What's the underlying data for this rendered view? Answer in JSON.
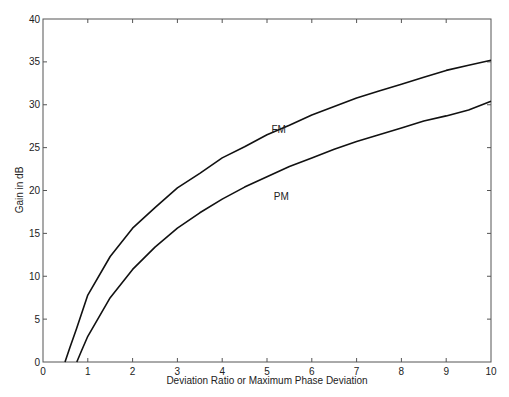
{
  "chart_data": {
    "type": "line",
    "title": "",
    "xlabel": "Deviation Ratio or Maximum Phase Deviation",
    "ylabel": "Gain in dB",
    "xlim": [
      0,
      10
    ],
    "ylim": [
      0,
      40
    ],
    "xticks": [
      0,
      1,
      2,
      3,
      4,
      5,
      6,
      7,
      8,
      9,
      10
    ],
    "yticks": [
      0,
      5,
      10,
      15,
      20,
      25,
      30,
      35,
      40
    ],
    "grid": false,
    "legend": "none (inline labels)",
    "annotations": [
      {
        "text": "FM",
        "x": 5.1,
        "y": 27.2
      },
      {
        "text": "PM",
        "x": 5.15,
        "y": 19.4
      }
    ],
    "series": [
      {
        "name": "FM",
        "color": "#111111",
        "x": [
          0.49,
          0.6,
          0.75,
          1,
          1.5,
          2,
          2.5,
          3,
          3.5,
          4,
          4.5,
          5,
          5.5,
          6,
          6.5,
          7,
          7.5,
          8,
          8.5,
          9,
          9.5,
          10
        ],
        "y": [
          0.0,
          1.7,
          3.9,
          7.8,
          12.3,
          15.6,
          18.0,
          20.3,
          22.0,
          23.8,
          25.1,
          26.5,
          27.6,
          28.8,
          29.8,
          30.8,
          31.6,
          32.4,
          33.2,
          34.0,
          34.6,
          35.2
        ]
      },
      {
        "name": "PM",
        "color": "#111111",
        "x": [
          0.755,
          0.85,
          1,
          1.5,
          2,
          2.5,
          3,
          3.5,
          4,
          4.5,
          5,
          5.5,
          6,
          6.5,
          7,
          7.5,
          8,
          8.5,
          9,
          9.5,
          10
        ],
        "y": [
          0.0,
          1.2,
          3.0,
          7.5,
          10.8,
          13.4,
          15.6,
          17.4,
          19.0,
          20.4,
          21.6,
          22.8,
          23.8,
          24.8,
          25.7,
          26.5,
          27.3,
          28.1,
          28.7,
          29.4,
          30.4
        ]
      }
    ]
  }
}
